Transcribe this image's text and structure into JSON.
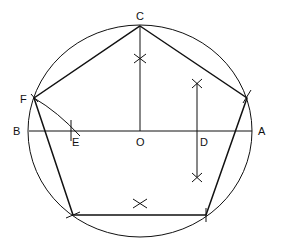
{
  "labels": {
    "C": "C",
    "F": "F",
    "B": "B",
    "E": "E",
    "O": "O",
    "D": "D",
    "A": "A"
  },
  "colors": {
    "stroke": "#111111",
    "background": "#ffffff"
  },
  "geometry": {
    "circle": {
      "cx": 140,
      "cy": 131,
      "rx": 112,
      "ry": 106
    },
    "points": {
      "C": [
        140,
        26
      ],
      "F": [
        34,
        98
      ],
      "G": [
        247,
        98
      ],
      "H": [
        206,
        215
      ],
      "I": [
        73,
        215
      ],
      "O": [
        140,
        131
      ],
      "A": [
        252,
        131
      ],
      "B": [
        29,
        131
      ],
      "E": [
        75,
        131
      ],
      "D": [
        197,
        131
      ]
    }
  }
}
